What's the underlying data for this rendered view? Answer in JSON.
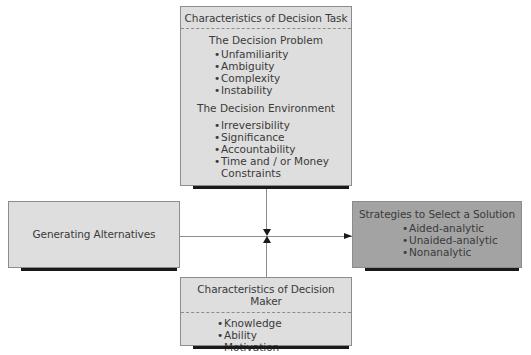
{
  "decision_task": {
    "title": "Characteristics of Decision Task",
    "problem": {
      "heading": "The Decision Problem",
      "items": [
        "Unfamiliarity",
        "Ambiguity",
        "Complexity",
        "Instability"
      ]
    },
    "environment": {
      "heading": "The Decision Environment",
      "items": [
        "Irreversibility",
        "Significance",
        "Accountability",
        "Time and / or Money",
        "Constraints"
      ]
    }
  },
  "generating": {
    "title": "Generating Alternatives"
  },
  "strategies": {
    "title": "Strategies to Select a Solution",
    "items": [
      "Aided-analytic",
      "Unaided-analytic",
      "Nonanalytic"
    ]
  },
  "decision_maker": {
    "title": "Characteristics of Decision Maker",
    "items": [
      "Knowledge",
      "Ability",
      "Motivation"
    ]
  },
  "bullet": "•",
  "colors": {
    "box_fill": "#dedede",
    "strategy_fill": "#a3a3a3",
    "shadow": "#1a1a1a",
    "border": "#8c8c8c"
  }
}
